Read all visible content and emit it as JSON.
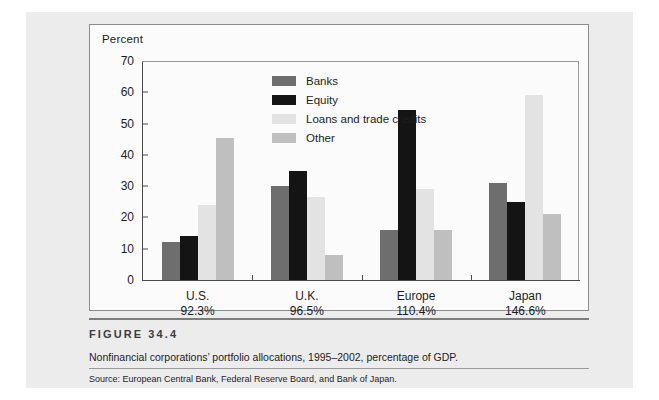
{
  "figure": {
    "number_label": "FIGURE 34.4",
    "caption": "Nonfinancial corporations’ portfolio allocations, 1995–2002, percentage of GDP.",
    "source": "Source: European Central Bank, Federal Reserve Board, and Bank of Japan."
  },
  "chart_data": {
    "type": "bar",
    "title": "",
    "subtitle": "",
    "xlabel": "",
    "ylabel": "Percent",
    "ylim": [
      0,
      70
    ],
    "yticks": [
      0,
      10,
      20,
      30,
      40,
      50,
      60,
      70
    ],
    "ytick_labels": [
      "0",
      "10",
      "20",
      "30",
      "40",
      "50",
      "60",
      "70"
    ],
    "grid": false,
    "legend_position": "inside-top-center",
    "categories": [
      "U.S.",
      "U.K.",
      "Europe",
      "Japan"
    ],
    "category_sublabels": [
      "92.3%",
      "96.5%",
      "110.4%",
      "146.6%"
    ],
    "series": [
      {
        "name": "Banks",
        "color": "#6e6e6e",
        "values": [
          12,
          30,
          16,
          31
        ]
      },
      {
        "name": "Equity",
        "color": "#141414",
        "values": [
          14,
          35,
          54.5,
          25
        ]
      },
      {
        "name": "Loans and trade credits",
        "color": "#e3e3e3",
        "values": [
          24,
          26.5,
          29,
          59
        ]
      },
      {
        "name": "Other",
        "color": "#bfbfbf",
        "values": [
          45.5,
          8,
          16,
          21
        ]
      }
    ]
  }
}
